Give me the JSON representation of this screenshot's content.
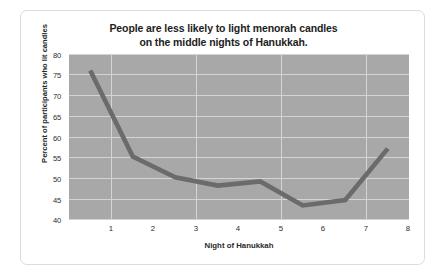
{
  "chart_data": {
    "type": "line",
    "title": "People are less likely to light menorah candles on the middle nights of Hanukkah.",
    "title_lines": [
      "People are less likely to light menorah candles",
      "on the middle nights of Hanukkah."
    ],
    "xlabel": "Night of Hanukkah",
    "ylabel": "Percent of participants who lit candles",
    "categories": [
      1,
      2,
      3,
      4,
      5,
      6,
      7,
      8
    ],
    "x_tick_labels": [
      "1",
      "2",
      "3",
      "4",
      "5",
      "6",
      "7",
      "8"
    ],
    "values": [
      76,
      55.3,
      50.3,
      48.3,
      49.3,
      43.5,
      44.8,
      57.2
    ],
    "ylim": [
      40,
      80
    ],
    "y_ticks": [
      80,
      75,
      70,
      65,
      60,
      55,
      50,
      45,
      40
    ],
    "y_tick_labels": [
      "80",
      "75",
      "70",
      "65",
      "60",
      "55",
      "50",
      "45",
      "40"
    ],
    "xlim": [
      0.5,
      8.5
    ],
    "grid": true,
    "legend": "none",
    "colors": {
      "line": "#6b6b6b",
      "plot_background": "#a8a8a8",
      "gridline": "#d4d4d4",
      "figure_background": "#ffffff",
      "border": "#dcdcdc",
      "text": "#2a2a2a"
    }
  }
}
